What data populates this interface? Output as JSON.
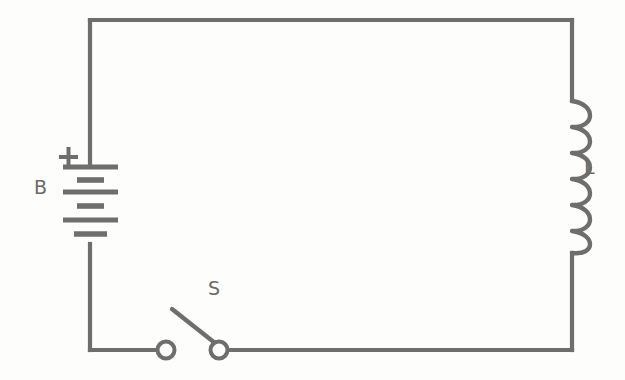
{
  "diagram": {
    "type": "electrical-schematic",
    "background_color": "#fdfdfc",
    "line_color": "#6e6e6e",
    "labels": {
      "battery": "B",
      "inductor": "L",
      "switch": "S",
      "polarity_positive": "+"
    },
    "components": [
      {
        "id": "battery",
        "name": "battery",
        "label": "B",
        "polarity_marker": "+",
        "position": "left-branch",
        "plate_count": 6,
        "cell_count": 3
      },
      {
        "id": "inductor",
        "name": "inductor",
        "label": "L",
        "position": "right-branch",
        "coil_turns": 6
      },
      {
        "id": "switch",
        "name": "switch",
        "label": "S",
        "position": "bottom-branch",
        "state": "open",
        "terminal_count": 2
      }
    ],
    "loop": {
      "left_x": 90,
      "right_x": 572,
      "top_y": 20,
      "bottom_y": 350
    }
  }
}
